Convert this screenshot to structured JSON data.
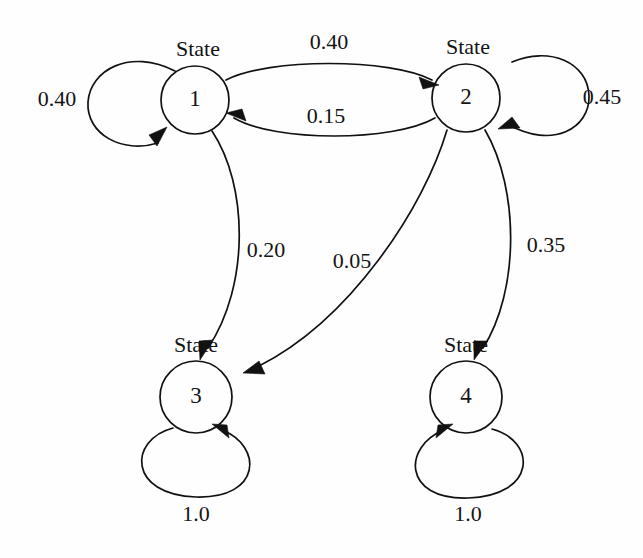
{
  "diagram": {
    "kind": "markov-state-transition-diagram",
    "caption_word": "State",
    "stroke_color": "#111111",
    "background_color": "#fefefe",
    "text_color": "#141414"
  },
  "nodes": [
    {
      "id": "1",
      "label": "1",
      "caption": "State",
      "cx": 195,
      "cy": 100,
      "r": 34
    },
    {
      "id": "2",
      "label": "2",
      "caption": "State",
      "cx": 466,
      "cy": 98,
      "r": 34
    },
    {
      "id": "3",
      "label": "3",
      "caption": "State",
      "cx": 196,
      "cy": 397,
      "r": 36
    },
    {
      "id": "4",
      "label": "4",
      "caption": "State",
      "cx": 466,
      "cy": 397,
      "r": 36
    }
  ],
  "edges": [
    {
      "from": "1",
      "to": "1",
      "weight": "0.40",
      "kind": "self-loop",
      "side": "left",
      "label_x": 57,
      "label_y": 106
    },
    {
      "from": "2",
      "to": "2",
      "weight": "0.45",
      "kind": "self-loop",
      "side": "right",
      "label_x": 602,
      "label_y": 104
    },
    {
      "from": "1",
      "to": "2",
      "weight": "0.40",
      "kind": "curve",
      "side": "upper",
      "label_x": 329,
      "label_y": 49
    },
    {
      "from": "2",
      "to": "1",
      "weight": "0.15",
      "kind": "curve",
      "side": "lower",
      "label_x": 326,
      "label_y": 123
    },
    {
      "from": "1",
      "to": "3",
      "weight": "0.20",
      "kind": "curve",
      "side": "right",
      "label_x": 266,
      "label_y": 257
    },
    {
      "from": "2",
      "to": "3",
      "weight": "0.05",
      "kind": "curve",
      "side": "left",
      "label_x": 352,
      "label_y": 268
    },
    {
      "from": "2",
      "to": "4",
      "weight": "0.35",
      "kind": "curve",
      "side": "right",
      "label_x": 546,
      "label_y": 252
    },
    {
      "from": "3",
      "to": "3",
      "weight": "1.0",
      "kind": "self-loop",
      "side": "bottom",
      "label_x": 196,
      "label_y": 521
    },
    {
      "from": "4",
      "to": "4",
      "weight": "1.0",
      "kind": "self-loop",
      "side": "bottom",
      "label_x": 468,
      "label_y": 521
    }
  ],
  "chart_data": {
    "type": "diagram",
    "title": "",
    "states": [
      "State 1",
      "State 2",
      "State 3",
      "State 4"
    ],
    "transition_probabilities": [
      {
        "from": "State 1",
        "to": "State 1",
        "p": 0.4
      },
      {
        "from": "State 1",
        "to": "State 2",
        "p": 0.4
      },
      {
        "from": "State 1",
        "to": "State 3",
        "p": 0.2
      },
      {
        "from": "State 2",
        "to": "State 1",
        "p": 0.15
      },
      {
        "from": "State 2",
        "to": "State 2",
        "p": 0.45
      },
      {
        "from": "State 2",
        "to": "State 3",
        "p": 0.05
      },
      {
        "from": "State 2",
        "to": "State 4",
        "p": 0.35
      },
      {
        "from": "State 3",
        "to": "State 3",
        "p": 1.0
      },
      {
        "from": "State 4",
        "to": "State 4",
        "p": 1.0
      }
    ]
  }
}
